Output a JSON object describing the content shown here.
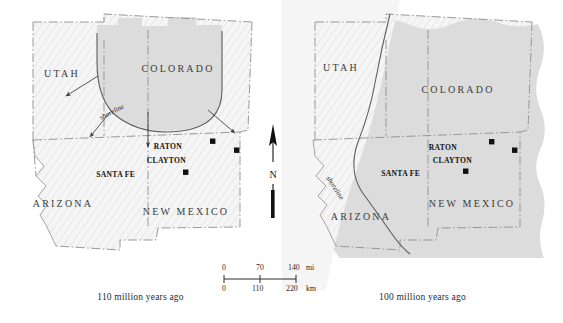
{
  "figure": {
    "type": "paleogeographic-map-pair",
    "width": 563,
    "height": 323,
    "background_color": "#ffffff"
  },
  "colors": {
    "land_fill": "#f4f4f4",
    "land_hatch": "#e2e2e2",
    "sea_fill": "#dcdcdc",
    "border_line": "#8c8c8c",
    "shoreline_line": "#5a5a5a",
    "text": "#2a2a2a",
    "city_marker": "#111111"
  },
  "panels": [
    {
      "id": "left",
      "caption": "110 million years ago",
      "states": [
        {
          "name": "UTAH",
          "x": 62,
          "y": 77
        },
        {
          "name": "COLORADO",
          "x": 178,
          "y": 72
        },
        {
          "name": "ARIZONA",
          "x": 63,
          "y": 207
        },
        {
          "name": "NEW MEXICO",
          "x": 186,
          "y": 215
        }
      ],
      "cities": [
        {
          "name": "RATON",
          "label_x": 182,
          "label_y": 149,
          "marker_x": 213,
          "marker_y": 142
        },
        {
          "name": "CLAYTON",
          "label_x": 186,
          "label_y": 163,
          "marker_x": 237,
          "marker_y": 151
        },
        {
          "name": "SANTA FE",
          "label_x": 135,
          "label_y": 177,
          "marker_x": 186,
          "marker_y": 173
        }
      ],
      "annotations": [
        {
          "label": "shoreline",
          "x": 101,
          "y": 120,
          "rotation": -27
        }
      ],
      "arrows": [
        {
          "x1": 98,
          "y1": 76,
          "x2": 66,
          "y2": 96
        },
        {
          "x1": 110,
          "y1": 112,
          "x2": 90,
          "y2": 137
        },
        {
          "x1": 148,
          "y1": 112,
          "x2": 148,
          "y2": 147
        },
        {
          "x1": 208,
          "y1": 110,
          "x2": 235,
          "y2": 133
        }
      ]
    },
    {
      "id": "right",
      "caption": "100 million years ago",
      "states": [
        {
          "name": "UTAH",
          "x": 59,
          "y": 71
        },
        {
          "name": "COLORADO",
          "x": 176,
          "y": 93
        },
        {
          "name": "ARIZONA",
          "x": 79,
          "y": 220
        },
        {
          "name": "NEW MEXICO",
          "x": 190,
          "y": 207
        }
      ],
      "cities": [
        {
          "name": "RATON",
          "label_x": 175,
          "label_y": 150,
          "marker_x": 210,
          "marker_y": 142
        },
        {
          "name": "CLAYTON",
          "label_x": 190,
          "label_y": 163,
          "marker_x": 233,
          "marker_y": 151
        },
        {
          "name": "SANTA FE",
          "label_x": 138,
          "label_y": 176,
          "marker_x": 184,
          "marker_y": 172
        }
      ],
      "annotations": [
        {
          "label": "shoreline",
          "x": 72,
          "y": 182,
          "rotation": 57
        }
      ],
      "arrows": []
    }
  ],
  "scalebar": {
    "miles": {
      "ticks": [
        "0",
        "70",
        "140"
      ],
      "unit": "mi"
    },
    "kilometers": {
      "ticks": [
        "0",
        "110",
        "220"
      ],
      "unit": "km"
    }
  },
  "north_arrow": {
    "label": "N"
  }
}
